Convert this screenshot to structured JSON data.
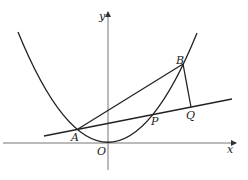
{
  "diagram": {
    "type": "coordinate-geometry",
    "axes": {
      "x_label": "x",
      "y_label": "y",
      "origin_label": "O"
    },
    "points": [
      {
        "name": "A",
        "label": "A"
      },
      {
        "name": "B",
        "label": "B"
      },
      {
        "name": "P",
        "label": "P"
      },
      {
        "name": "Q",
        "label": "Q"
      },
      {
        "name": "O",
        "label": "O"
      }
    ],
    "curves": [
      {
        "name": "parabola",
        "description": "upward-opening parabola with vertex near origin O, passing through A, P, B"
      }
    ],
    "segments": [
      {
        "name": "line-AQ",
        "description": "line through A, P, Q"
      },
      {
        "name": "segment-AB",
        "description": "chord from A to B"
      },
      {
        "name": "segment-BQ",
        "description": "segment from B to Q"
      }
    ],
    "colors": {
      "axis": "#777777",
      "stroke": "#222222",
      "background": "#ffffff"
    }
  }
}
